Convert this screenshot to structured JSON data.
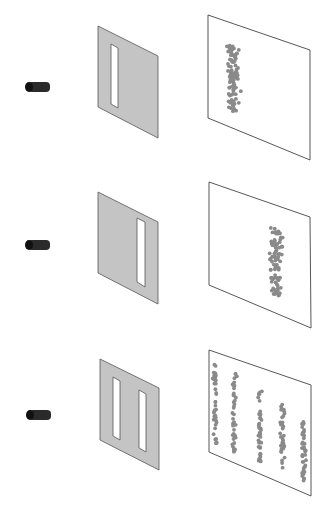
{
  "figure": {
    "header_text_cropped": "",
    "colors": {
      "background": "#ffffff",
      "barrier_fill": "#c4c4c4",
      "barrier_stroke": "#555555",
      "slit_fill": "#ffffff",
      "screen_stroke": "#444444",
      "dot": "#8a8a8a",
      "emitter": "#2a2a2a"
    },
    "panels": [
      {
        "id": "single-slit-left",
        "emitter": {
          "x": 25,
          "y": 82,
          "w": 25,
          "h": 10
        },
        "barrier": {
          "tl": [
            98,
            26
          ],
          "tr": [
            158,
            56
          ],
          "br": [
            158,
            138
          ],
          "bl": [
            98,
            107
          ]
        },
        "slits": [
          {
            "tl": [
              111,
              44
            ],
            "tr": [
              118,
              48
            ],
            "br": [
              118,
              108
            ],
            "bl": [
              111,
              104
            ]
          }
        ],
        "screen": {
          "tl": [
            208,
            15
          ],
          "tr": [
            310,
            50
          ],
          "br": [
            310,
            160
          ],
          "bl": [
            208,
            118
          ]
        },
        "pattern": "single band near left of screen"
      },
      {
        "id": "single-slit-right",
        "emitter": {
          "x": 25,
          "y": 240,
          "w": 25,
          "h": 10
        },
        "barrier": {
          "tl": [
            98,
            192
          ],
          "tr": [
            158,
            222
          ],
          "br": [
            158,
            304
          ],
          "bl": [
            98,
            273
          ]
        },
        "slits": [
          {
            "tl": [
              137,
              218
            ],
            "tr": [
              145,
              222
            ],
            "br": [
              145,
              287
            ],
            "bl": [
              137,
              282
            ]
          }
        ],
        "screen": {
          "tl": [
            209,
            182
          ],
          "tr": [
            310,
            217
          ],
          "br": [
            311,
            328
          ],
          "bl": [
            209,
            285
          ]
        },
        "pattern": "single band near right of screen"
      },
      {
        "id": "double-slit",
        "emitter": {
          "x": 26,
          "y": 410,
          "w": 25,
          "h": 10
        },
        "barrier": {
          "tl": [
            100,
            359
          ],
          "tr": [
            159,
            388
          ],
          "br": [
            159,
            470
          ],
          "bl": [
            100,
            440
          ]
        },
        "slits": [
          {
            "tl": [
              113,
              377
            ],
            "tr": [
              120,
              381
            ],
            "br": [
              120,
              440
            ],
            "bl": [
              113,
              436
            ]
          },
          {
            "tl": [
              139,
              390
            ],
            "tr": [
              146,
              394
            ],
            "br": [
              146,
              452
            ],
            "bl": [
              139,
              448
            ]
          }
        ],
        "screen": {
          "tl": [
            209,
            350
          ],
          "tr": [
            311,
            385
          ],
          "br": [
            311,
            496
          ],
          "bl": [
            209,
            452
          ]
        },
        "pattern": "five interference bands"
      }
    ]
  }
}
